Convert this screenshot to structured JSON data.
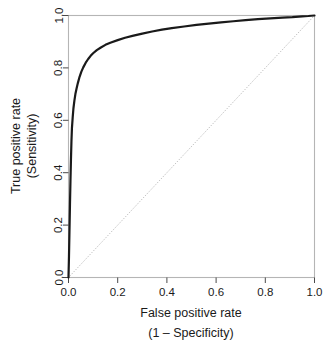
{
  "chart_data": {
    "type": "line",
    "title": "",
    "xlabel": "False positive rate",
    "xlabel_sub": "(1 – Specificity)",
    "ylabel": "True positive rate",
    "ylabel_sub": "(Sensitivity)",
    "xlim": [
      0,
      1
    ],
    "ylim": [
      0,
      1
    ],
    "grid": false,
    "legend": "none",
    "xticks": [
      "0.0",
      "0.2",
      "0.4",
      "0.6",
      "0.8",
      "1.0"
    ],
    "xtick_values": [
      0,
      0.2,
      0.4,
      0.6,
      0.8,
      1
    ],
    "yticks": [
      "0.0",
      "0.2",
      "0.4",
      "0.6",
      "0.8",
      "1.0"
    ],
    "ytick_values": [
      0,
      0.2,
      0.4,
      0.6,
      0.8,
      1
    ],
    "series": [
      {
        "name": "ROC curve",
        "style": "solid",
        "color": "#1a1a1a",
        "width": 2.2,
        "x": [
          0.0,
          0.002,
          0.004,
          0.006,
          0.008,
          0.01,
          0.012,
          0.014,
          0.017,
          0.02,
          0.024,
          0.028,
          0.033,
          0.038,
          0.045,
          0.052,
          0.06,
          0.07,
          0.08,
          0.09,
          0.1,
          0.115,
          0.13,
          0.15,
          0.17,
          0.2,
          0.23,
          0.26,
          0.3,
          0.34,
          0.38,
          0.42,
          0.47,
          0.52,
          0.57,
          0.62,
          0.67,
          0.72,
          0.77,
          0.82,
          0.87,
          0.91,
          0.95,
          0.975,
          1.0
        ],
        "y": [
          0.0,
          0.08,
          0.18,
          0.28,
          0.37,
          0.45,
          0.52,
          0.57,
          0.61,
          0.645,
          0.675,
          0.7,
          0.722,
          0.742,
          0.766,
          0.785,
          0.802,
          0.82,
          0.834,
          0.846,
          0.856,
          0.868,
          0.877,
          0.888,
          0.896,
          0.906,
          0.915,
          0.922,
          0.931,
          0.939,
          0.946,
          0.952,
          0.958,
          0.964,
          0.969,
          0.974,
          0.978,
          0.982,
          0.986,
          0.989,
          0.992,
          0.994,
          0.997,
          0.998,
          1.0
        ]
      },
      {
        "name": "Chance diagonal",
        "style": "dotted",
        "color": "#9a9a9a",
        "width": 0.8,
        "x": [
          0,
          1
        ],
        "y": [
          0,
          1
        ]
      }
    ]
  },
  "axes": {
    "box_color": "#b5b5b5",
    "tick_color": "#4a4a4a"
  }
}
